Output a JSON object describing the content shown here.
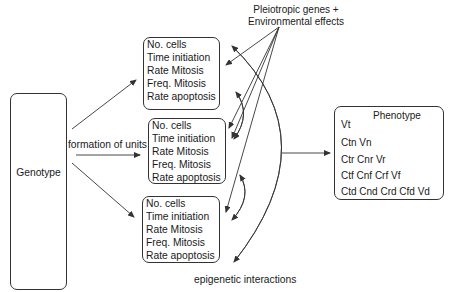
{
  "genotype": {
    "label": "Genotype"
  },
  "formation_label": "formation of units",
  "pleiotropic_label": {
    "line1": "Pleiotropic genes +",
    "line2": "Environmental effects"
  },
  "epigenetic_label": "epigenetic interactions",
  "units": [
    {
      "items": [
        "No. cells",
        "Time initiation",
        "Rate Mitosis",
        "Freq. Mitosis",
        "Rate apoptosis"
      ]
    },
    {
      "items": [
        "No. cells",
        "Time initiation",
        "Rate Mitosis",
        "Freq. Mitosis",
        "Rate apoptosis"
      ]
    },
    {
      "items": [
        "No. cells",
        "Time initiation",
        "Rate Mitosis",
        "Freq. Mitosis",
        "Rate apoptosis"
      ]
    }
  ],
  "phenotype": {
    "title": "Phenotype",
    "rows": [
      "Vt",
      "Ctn Vn",
      "Ctr Cnr Vr",
      "Ctf Cnf Crf Vf",
      "Ctd Cnd Crd Cfd Vd"
    ]
  },
  "colors": {
    "line": "#333333",
    "text": "#1a1a1a",
    "background": "#ffffff"
  }
}
